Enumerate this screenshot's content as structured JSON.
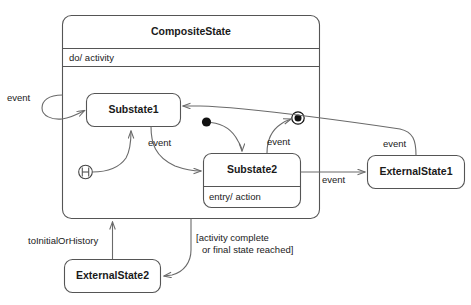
{
  "diagram": {
    "type": "uml-state-machine",
    "title": "CompositeState",
    "composite_state": {
      "name": "CompositeState",
      "activity_compartment": "do/ activity"
    },
    "states": {
      "substate1": {
        "name": "Substate1"
      },
      "substate2": {
        "name": "Substate2",
        "entry_action": "entry/ action"
      },
      "external1": {
        "name": "ExternalState1"
      },
      "external2": {
        "name": "ExternalState2"
      }
    },
    "pseudostates": {
      "initial": "initial-state",
      "final": "final-state",
      "history": "H"
    },
    "transitions": {
      "self_loop_event": "event",
      "sub1_to_sub2_event": "event",
      "sub2_to_final_event": "event",
      "sub2_to_external1_event": "event",
      "external1_to_sub1_event": "event",
      "composite_to_external2_guard_line1": "[activity complete",
      "composite_to_external2_guard_line2": "or final state reached]",
      "external2_to_composite": "toInitialOrHistory"
    },
    "colors": {
      "stroke": "#555555",
      "edge": "#6a6a6a",
      "text": "#1a1a1a",
      "fill": "#ffffff"
    }
  }
}
